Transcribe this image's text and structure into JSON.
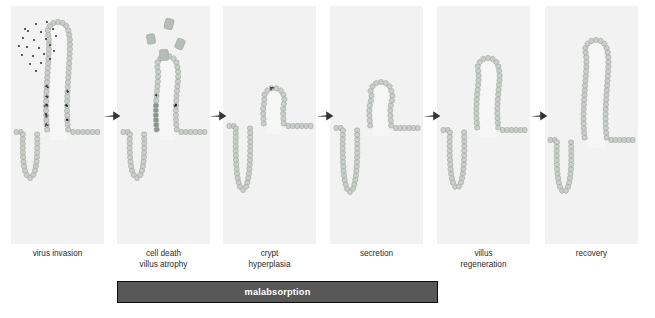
{
  "figure": {
    "title_visible": false,
    "background_color": "#ffffff",
    "panel_background_color": "#f2f2f2",
    "cell_fill_color": "#c9cec9",
    "cell_stroke_color": "#9aa09a",
    "dying_cell_color": "#8d948d",
    "virus_color": "#111111",
    "arrow_color": "#333333",
    "bar_fill_color": "#585858",
    "bar_border_color": "#0d0d0d",
    "bar_text_color": "#ffffff"
  },
  "panels": [
    {
      "id": "virus-invasion",
      "label": "virus invasion",
      "label_lines": [
        "virus invasion"
      ],
      "x": 11,
      "y": 6,
      "w": 93,
      "h": 238,
      "villus_height": "tall",
      "has_free_virus_cloud": true,
      "free_virus_count": 22,
      "infected_cell_clusters": 8,
      "dying_cells": 0,
      "sloughed_cells": 0
    },
    {
      "id": "cell-death-villus-atrophy",
      "label": "cell death villus atrophy",
      "label_lines": [
        "cell death",
        "villus atrophy"
      ],
      "x": 117,
      "y": 6,
      "w": 93,
      "h": 238,
      "villus_height": "medium-short",
      "has_free_virus_cloud": false,
      "free_virus_count": 0,
      "infected_cell_clusters": 2,
      "dying_cells": 5,
      "sloughed_cells": 4
    },
    {
      "id": "crypt-hyperplasia",
      "label": "crypt hyperplasia",
      "label_lines": [
        "crypt",
        "hyperplasia"
      ],
      "x": 223,
      "y": 6,
      "w": 93,
      "h": 238,
      "villus_height": "short",
      "has_free_virus_cloud": false,
      "free_virus_count": 0,
      "infected_cell_clusters": 1,
      "dying_cells": 1,
      "sloughed_cells": 0
    },
    {
      "id": "secretion",
      "label": "secretion",
      "label_lines": [
        "secretion"
      ],
      "x": 330,
      "y": 6,
      "w": 93,
      "h": 238,
      "villus_height": "short-medium",
      "has_free_virus_cloud": false,
      "free_virus_count": 0,
      "infected_cell_clusters": 0,
      "dying_cells": 0,
      "sloughed_cells": 0
    },
    {
      "id": "villus-regeneration",
      "label": "villus regeneration",
      "label_lines": [
        "villus",
        "regeneration"
      ],
      "x": 437,
      "y": 6,
      "w": 93,
      "h": 238,
      "villus_height": "medium-tall",
      "has_free_virus_cloud": false,
      "free_virus_count": 0,
      "infected_cell_clusters": 0,
      "dying_cells": 0,
      "sloughed_cells": 0
    },
    {
      "id": "recovery",
      "label": "recovery",
      "label_lines": [
        "recovery"
      ],
      "x": 545,
      "y": 6,
      "w": 93,
      "h": 238,
      "villus_height": "tall",
      "has_free_virus_cloud": false,
      "free_virus_count": 0,
      "infected_cell_clusters": 0,
      "dying_cells": 0,
      "sloughed_cells": 0
    }
  ],
  "arrows": [
    {
      "id": "arrow-1",
      "from": "virus-invasion",
      "to": "cell-death-villus-atrophy",
      "x": 103,
      "y": 108
    },
    {
      "id": "arrow-2",
      "from": "cell-death-villus-atrophy",
      "to": "crypt-hyperplasia",
      "x": 209,
      "y": 108
    },
    {
      "id": "arrow-3",
      "from": "crypt-hyperplasia",
      "to": "secretion",
      "x": 316,
      "y": 108
    },
    {
      "id": "arrow-4",
      "from": "secretion",
      "to": "villus-regeneration",
      "x": 423,
      "y": 108
    },
    {
      "id": "arrow-5",
      "from": "villus-regeneration",
      "to": "recovery",
      "x": 530,
      "y": 108
    }
  ],
  "bar": {
    "label": "malabsorption",
    "x": 117,
    "y": 281,
    "w": 321,
    "h": 22,
    "spans_panels": [
      "cell-death-villus-atrophy",
      "crypt-hyperplasia",
      "secretion"
    ]
  }
}
